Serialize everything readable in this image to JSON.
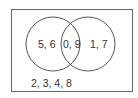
{
  "diagram": {
    "type": "venn",
    "universe_only": "2, 3, 4, 8",
    "left_only": "5, 6",
    "intersection": "0, 9",
    "right_only": "1, 7",
    "colors": {
      "stroke": "#555555",
      "text": "#333333",
      "background": "#ffffff"
    }
  }
}
